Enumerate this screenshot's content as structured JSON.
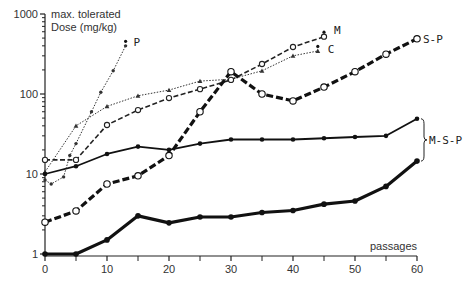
{
  "chart_data": {
    "type": "line",
    "title": "",
    "xlabel": "passages",
    "ylabel": "max. tolerated Dose (mg/kg)",
    "ylabel_lines": [
      "max. tolerated",
      "Dose (mg/kg)"
    ],
    "yscale": "log",
    "xlim": [
      0,
      60
    ],
    "ylim": [
      1,
      1000
    ],
    "grid": false,
    "x_ticks": [
      0,
      10,
      20,
      30,
      40,
      50,
      60
    ],
    "x_minor_ticks": [
      5,
      15,
      25,
      35,
      45,
      55
    ],
    "y_ticks": [
      1,
      10,
      100,
      1000
    ],
    "y_tick_labels": [
      "1",
      "10",
      "100",
      "1000"
    ],
    "series": [
      {
        "name": "P",
        "label": "P",
        "style": "dotted-thin",
        "marker": "dot",
        "x": [
          0,
          1,
          3,
          4,
          5,
          7.5,
          9,
          11,
          13
        ],
        "y": [
          8.4,
          7.5,
          9.2,
          17,
          24,
          60,
          105,
          195,
          400
        ],
        "end_marker_above": true
      },
      {
        "name": "C",
        "label": "C",
        "style": "dotted-thin",
        "marker": "triangle",
        "x": [
          0,
          5,
          10,
          15,
          20,
          25,
          30,
          35,
          40,
          44
        ],
        "y": [
          10.6,
          40,
          70,
          95,
          112,
          145,
          153,
          195,
          300,
          345
        ],
        "end_marker_above": true
      },
      {
        "name": "M",
        "label": "M",
        "style": "dashed-medium",
        "marker": "open-circle",
        "x": [
          0,
          5,
          10,
          15,
          20,
          25,
          30,
          35,
          40,
          45
        ],
        "y": [
          15,
          15,
          41,
          63,
          89,
          115,
          150,
          237,
          387,
          520
        ],
        "end_marker_above": true
      },
      {
        "name": "S-P",
        "label": "S-P",
        "style": "dashed-heavy",
        "marker": "open-circle",
        "x": [
          0,
          5,
          10,
          15,
          20,
          25,
          30,
          35,
          40,
          45,
          50,
          55,
          60
        ],
        "y": [
          2.5,
          3.45,
          7.5,
          9.5,
          17,
          60,
          190,
          100,
          82,
          122,
          190,
          315,
          490
        ],
        "end_marker_above": false
      },
      {
        "name": "M-S-P (upper)",
        "label": "M-S-P",
        "style": "solid-medium",
        "marker": "dot",
        "x": [
          0,
          5,
          10,
          15,
          20,
          25,
          30,
          35,
          40,
          45,
          50,
          55,
          60
        ],
        "y": [
          10,
          12.5,
          17.8,
          22,
          20,
          24,
          27,
          27,
          27,
          28,
          29,
          30,
          49
        ],
        "end_marker_above": false
      },
      {
        "name": "M-S-P (lower)",
        "label": "M-S-P",
        "style": "solid-heavy",
        "marker": "dot",
        "x": [
          0,
          5,
          10,
          15,
          20,
          25,
          30,
          35,
          40,
          45,
          50,
          55,
          60
        ],
        "y": [
          1,
          1,
          1.5,
          3.0,
          2.45,
          2.9,
          2.9,
          3.3,
          3.5,
          4.2,
          4.6,
          7,
          14.5
        ],
        "end_marker_above": false
      }
    ],
    "annotations": [
      {
        "text": "M-S-P",
        "type": "bracket",
        "groups": [
          "M-S-P (upper)",
          "M-S-P (lower)"
        ]
      }
    ]
  }
}
